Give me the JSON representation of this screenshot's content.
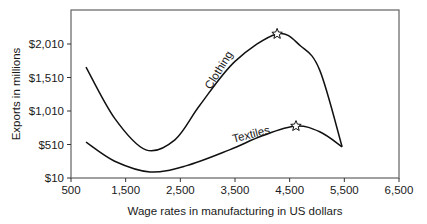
{
  "chart_data": {
    "type": "line",
    "title": "",
    "xlabel": "Wage rates in manufacturing in US dollars",
    "ylabel": "Exports in millions",
    "xlim": [
      500,
      6500
    ],
    "ylim": [
      10,
      2400
    ],
    "x_ticks": [
      "500",
      "1,500",
      "2,500",
      "3,500",
      "4,500",
      "5,500",
      "6,500"
    ],
    "x_tick_values": [
      500,
      1500,
      2500,
      3500,
      4500,
      5500,
      6500
    ],
    "y_ticks": [
      "$10",
      "$510",
      "$1,010",
      "$1,510",
      "$2,010"
    ],
    "y_tick_values": [
      10,
      510,
      1010,
      1510,
      2010
    ],
    "grid": false,
    "legend": "none (inline curve labels)",
    "series": [
      {
        "name": "Clothing",
        "label": "Clothing",
        "x": [
          775,
          1300,
          1870,
          2400,
          2860,
          3500,
          4270,
          4700,
          5050,
          5460
        ],
        "y": [
          1665,
          900,
          430,
          580,
          1100,
          1750,
          2160,
          1980,
          1620,
          475
        ],
        "peak_marker": {
          "x": 4270,
          "y": 2160,
          "symbol": "star"
        }
      },
      {
        "name": "Textiles",
        "label": "Textiles",
        "x": [
          775,
          1300,
          1945,
          2600,
          3400,
          4000,
          4615,
          5050,
          5460
        ],
        "y": [
          545,
          260,
          100,
          190,
          430,
          640,
          785,
          700,
          475
        ],
        "peak_marker": {
          "x": 4615,
          "y": 785,
          "symbol": "star"
        }
      }
    ]
  }
}
